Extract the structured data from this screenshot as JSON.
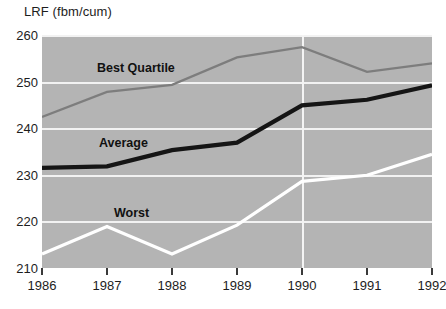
{
  "chart_data": {
    "type": "line",
    "title": "LRF (fbm/cum)",
    "xlabel": "",
    "ylabel": "LRF (fbm/cum)",
    "x": [
      1986,
      1987,
      1988,
      1989,
      1990,
      1991,
      1992
    ],
    "xtick_labels": [
      "1986",
      "1987",
      "1988",
      "1989",
      "1990",
      "1991",
      "1992"
    ],
    "ytick_labels": [
      "260",
      "250",
      "240",
      "230",
      "220",
      "210"
    ],
    "yticks": [
      260,
      250,
      240,
      230,
      220,
      210
    ],
    "ylim": [
      210,
      260
    ],
    "xlim": [
      1986,
      1992
    ],
    "grid": "horizontal-gridlines-plus-vertical-at-1990",
    "legend": "inline-labels",
    "series": [
      {
        "name": "Best Quartile",
        "color": "#7d7d7d",
        "values": [
          242.4,
          247.8,
          249.3,
          255.2,
          257.4,
          252.1,
          253.9
        ]
      },
      {
        "name": "Average",
        "color": "#151515",
        "values": [
          231.5,
          231.8,
          235.3,
          236.9,
          244.9,
          246.1,
          249.2
        ]
      },
      {
        "name": "Worst",
        "color": "#ffffff",
        "values": [
          213.0,
          218.9,
          213.0,
          219.2,
          228.6,
          229.9,
          234.4
        ]
      }
    ]
  },
  "plot": {
    "background_color": "#b4b4b4",
    "gridline_color": "#f2f2f2"
  },
  "caption": {
    "text": ""
  }
}
